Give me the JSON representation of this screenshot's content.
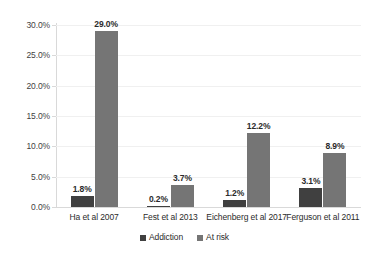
{
  "chart_data": {
    "type": "bar",
    "title": "",
    "subtitle": "",
    "xlabel": "",
    "ylabel": "",
    "categories": [
      "Ha et al 2007",
      "Fest et al 2013",
      "Eichenberg et al 2017",
      "Ferguson et al 2011"
    ],
    "series": [
      {
        "name": "Addiction",
        "color": "#404040",
        "values": [
          1.8,
          0.2,
          1.2,
          3.1
        ],
        "labels": [
          "1.8%",
          "0.2%",
          "1.2%",
          "3.1%"
        ]
      },
      {
        "name": "At risk",
        "color": "#757575",
        "values": [
          29.0,
          3.7,
          12.2,
          8.9
        ],
        "labels": [
          "29.0%",
          "3.7%",
          "12.2%",
          "8.9%"
        ]
      }
    ],
    "ylim": [
      0,
      30
    ],
    "ytick_values": [
      0,
      5,
      10,
      15,
      20,
      25,
      30
    ],
    "ytick_labels": [
      "0.0%",
      "5.0%",
      "10.0%",
      "15.0%",
      "20.0%",
      "25.0%",
      "30.0%"
    ],
    "grid": true,
    "grid_axis": "y",
    "legend_position": "bottom",
    "legend_entries": [
      "Addiction",
      "At risk"
    ],
    "value_suffix": "%"
  },
  "legend": {
    "items": [
      {
        "label": "Addiction",
        "color": "#404040"
      },
      {
        "label": "At risk",
        "color": "#757575"
      }
    ]
  },
  "colors": {
    "background": "#ffffff",
    "series_addiction": "#404040",
    "series_at_risk": "#757575",
    "gridline": "#f0f0f0",
    "axis": "#d9d9d9",
    "text": "#2b2b2b"
  }
}
